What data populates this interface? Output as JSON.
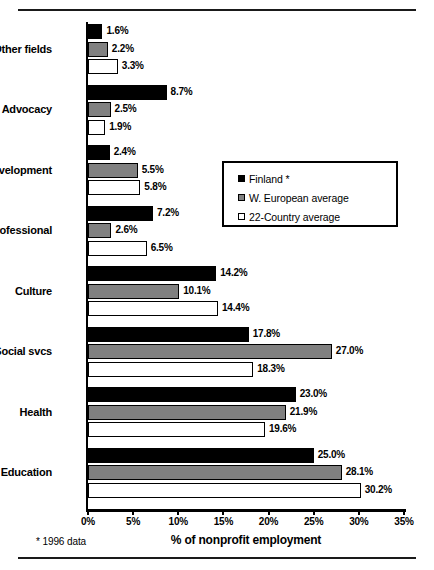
{
  "figure": {
    "footnote": "* 1996 data",
    "top_rule": "horizontal-rule",
    "bottom_rule": "horizontal-rule"
  },
  "chart_data": {
    "type": "bar",
    "orientation": "horizontal",
    "title": "",
    "xlabel": "% of nonprofit employment",
    "ylabel": "",
    "xlim": [
      0,
      35
    ],
    "xticks": [
      0,
      5,
      10,
      15,
      20,
      25,
      30,
      35
    ],
    "xticklabels": [
      "0%",
      "5%",
      "10%",
      "15%",
      "20%",
      "25%",
      "30%",
      "35%"
    ],
    "grid": false,
    "legend_position": "middle-right-inside",
    "categories": [
      "Other fields",
      "Advocacy",
      "Development",
      "Professional",
      "Culture",
      "Social svcs",
      "Health",
      "Education"
    ],
    "series": [
      {
        "name": "Finland *",
        "color": "#000000",
        "values": [
          1.6,
          8.7,
          2.4,
          7.2,
          14.2,
          17.8,
          23.0,
          25.0
        ],
        "labels": [
          "1.6%",
          "8.7%",
          "2.4%",
          "7.2%",
          "14.2%",
          "17.8%",
          "23.0%",
          "25.0%"
        ]
      },
      {
        "name": "W. European average",
        "color": "#808080",
        "values": [
          2.2,
          2.5,
          5.5,
          2.6,
          10.1,
          27.0,
          21.9,
          28.1
        ],
        "labels": [
          "2.2%",
          "2.5%",
          "5.5%",
          "2.6%",
          "10.1%",
          "27.0%",
          "21.9%",
          "28.1%"
        ]
      },
      {
        "name": "22-Country average",
        "color": "#ffffff",
        "values": [
          3.3,
          1.9,
          5.8,
          6.5,
          14.4,
          18.3,
          19.6,
          30.2
        ],
        "labels": [
          "3.3%",
          "1.9%",
          "5.8%",
          "6.5%",
          "14.4%",
          "18.3%",
          "19.6%",
          "30.2%"
        ]
      }
    ]
  }
}
